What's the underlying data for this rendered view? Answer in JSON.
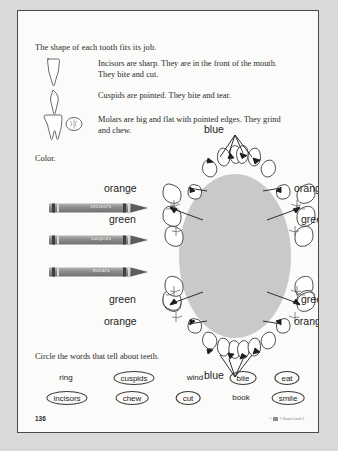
{
  "page": {
    "intro": "The shape of each tooth fits its job.",
    "color_instruction": "Color.",
    "circle_instruction": "Circle the words that tell about teeth.",
    "page_number": "136",
    "copyright": "© Saxon Level 1"
  },
  "tooth_facts": [
    {
      "icon": "incisor-tooth-icon",
      "text": "Incisors are sharp. They are in the front of the mouth. They bite and cut."
    },
    {
      "icon": "cuspid-tooth-icon",
      "text": "Cuspids are pointed. They bite and tear."
    },
    {
      "icon": "molar-tooth-icon",
      "text": "Molars are big and flat with pointed edges. They grind and chew."
    }
  ],
  "crayons": [
    {
      "label": "incisors",
      "color": "#8a8a8a"
    },
    {
      "label": "cuspids",
      "color": "#8a8a8a"
    },
    {
      "label": "molars",
      "color": "#8a8a8a"
    }
  ],
  "mouth_diagram": {
    "cavity_color": "#c9c9c9",
    "labels": [
      {
        "text": "blue",
        "position": "top-center"
      },
      {
        "text": "orange",
        "position": "upper-left"
      },
      {
        "text": "orange",
        "position": "upper-right"
      },
      {
        "text": "green",
        "position": "mid-left"
      },
      {
        "text": "green",
        "position": "mid-right"
      },
      {
        "text": "green",
        "position": "lower-left"
      },
      {
        "text": "green",
        "position": "lower-right"
      },
      {
        "text": "orange",
        "position": "bottom-left"
      },
      {
        "text": "orange",
        "position": "bottom-right"
      },
      {
        "text": "blue",
        "position": "bottom-center"
      }
    ]
  },
  "word_bank": {
    "rows": [
      [
        {
          "word": "ring",
          "circled": false,
          "x": 26
        },
        {
          "word": "cuspids",
          "circled": true,
          "x": 94
        },
        {
          "word": "wind",
          "circled": false,
          "x": 155
        },
        {
          "word": "bite",
          "circled": true,
          "x": 203
        },
        {
          "word": "eat",
          "circled": true,
          "x": 247
        }
      ],
      [
        {
          "word": "incisors",
          "circled": true,
          "x": 27
        },
        {
          "word": "chew",
          "circled": true,
          "x": 92
        },
        {
          "word": "cut",
          "circled": true,
          "x": 148
        },
        {
          "word": "book",
          "circled": false,
          "x": 201
        },
        {
          "word": "smile",
          "circled": true,
          "x": 248
        }
      ]
    ]
  }
}
